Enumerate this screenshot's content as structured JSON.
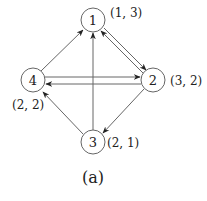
{
  "diagram": {
    "type": "directed-graph",
    "caption": "(a)",
    "nodes": [
      {
        "id": "1",
        "label": "1",
        "coord": "(1, 3)"
      },
      {
        "id": "2",
        "label": "2",
        "coord": "(3, 2)"
      },
      {
        "id": "3",
        "label": "3",
        "coord": "(2, 1)"
      },
      {
        "id": "4",
        "label": "4",
        "coord": "(2, 2)"
      }
    ],
    "edges": [
      {
        "from": "1",
        "to": "2"
      },
      {
        "from": "2",
        "to": "1"
      },
      {
        "from": "4",
        "to": "1"
      },
      {
        "from": "3",
        "to": "1"
      },
      {
        "from": "4",
        "to": "2"
      },
      {
        "from": "2",
        "to": "4"
      },
      {
        "from": "3",
        "to": "4"
      },
      {
        "from": "2",
        "to": "3"
      }
    ],
    "colors": {
      "stroke": "#555555",
      "text": "#222222",
      "background": "#ffffff"
    }
  }
}
